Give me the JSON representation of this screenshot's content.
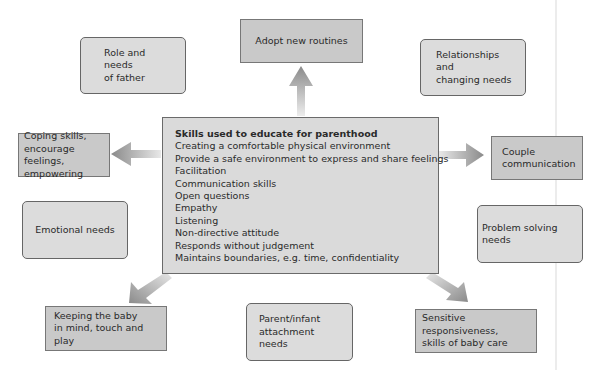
{
  "center": {
    "title": "Skills used to educate for parenthood",
    "items": [
      "Creating a comfortable physical environment",
      "Provide a safe environment to express and share feelings",
      "Facilitation",
      "Communication skills",
      "Open questions",
      "Empathy",
      "Listening",
      "Non-directive attitude",
      "Responds without judgement",
      "Maintains boundaries, e.g. time, confidentiality"
    ]
  },
  "outcomes": {
    "top": "Adopt new routines",
    "left": "Coping skills,\nencourage feelings,\nempowering",
    "right": "Couple\ncommunication",
    "bottom_left": "Keeping the baby\nin mind, touch and play",
    "bottom_right": "Sensitive responsiveness,\nskills of baby care"
  },
  "needs": {
    "father": "Role and needs\nof father",
    "relationships": "Relationships and\nchanging needs",
    "emotional": "Emotional needs",
    "problem_solving": "Problem solving\nneeds",
    "attachment": "Parent/infant\nattachment needs"
  },
  "colors": {
    "outcome_box": "#c9c9c9",
    "needs_box": "#dcdcdc",
    "center_box": "#dadada",
    "arrow": "#8c8c8c"
  }
}
